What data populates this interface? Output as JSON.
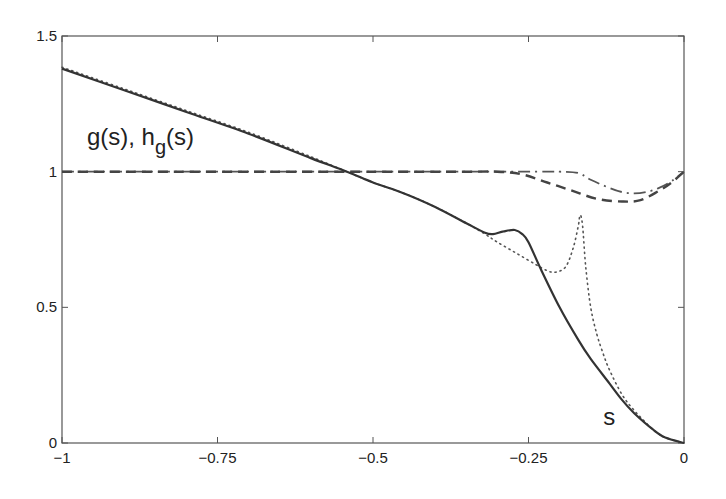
{
  "chart_data": {
    "type": "line",
    "title": "",
    "xlabel": "",
    "ylabel": "",
    "xlim": [
      -1,
      0
    ],
    "ylim": [
      0,
      1.5
    ],
    "grid": false,
    "legend": null,
    "x_ticks": [
      -1,
      -0.75,
      -0.5,
      -0.25,
      0
    ],
    "x_tick_labels": [
      "−1",
      "−0.75",
      "−0.5",
      "−0.25",
      "0"
    ],
    "y_ticks": [
      0,
      0.5,
      1,
      1.5
    ],
    "y_tick_labels": [
      "0",
      "0.5",
      "1",
      "1.5"
    ],
    "annotations": [
      {
        "text": "g(s), h",
        "sub": "g",
        "suffix": "(s)",
        "x": -0.96,
        "y": 1.1
      },
      {
        "text": "s",
        "x": -0.13,
        "y": 0.05
      }
    ],
    "series": [
      {
        "name": "s (solid)",
        "style": "solid",
        "x": [
          -1,
          -0.9,
          -0.8,
          -0.7,
          -0.6,
          -0.542,
          -0.5,
          -0.45,
          -0.4,
          -0.35,
          -0.32,
          -0.307,
          -0.29,
          -0.272,
          -0.26,
          -0.25,
          -0.23,
          -0.2,
          -0.17,
          -0.15,
          -0.12,
          -0.1,
          -0.08,
          -0.05,
          -0.03,
          0
        ],
        "y": [
          1.38,
          1.3,
          1.22,
          1.14,
          1.05,
          1.0,
          0.96,
          0.92,
          0.87,
          0.81,
          0.775,
          0.77,
          0.78,
          0.785,
          0.77,
          0.74,
          0.64,
          0.5,
          0.38,
          0.31,
          0.22,
          0.16,
          0.11,
          0.05,
          0.02,
          0.0
        ]
      },
      {
        "name": "dotted",
        "style": "dotted",
        "x": [
          -1,
          -0.9,
          -0.8,
          -0.7,
          -0.6,
          -0.542,
          -0.5,
          -0.45,
          -0.4,
          -0.35,
          -0.32,
          -0.3,
          -0.27,
          -0.24,
          -0.22,
          -0.206,
          -0.19,
          -0.178,
          -0.17,
          -0.167,
          -0.163,
          -0.158,
          -0.15,
          -0.14,
          -0.13,
          -0.12,
          -0.1,
          -0.08,
          -0.05,
          -0.03,
          0
        ],
        "y": [
          1.385,
          1.305,
          1.225,
          1.145,
          1.055,
          1.0,
          0.96,
          0.92,
          0.87,
          0.81,
          0.77,
          0.74,
          0.7,
          0.66,
          0.635,
          0.63,
          0.65,
          0.72,
          0.8,
          0.84,
          0.8,
          0.65,
          0.5,
          0.4,
          0.33,
          0.27,
          0.18,
          0.12,
          0.05,
          0.02,
          0.0
        ]
      },
      {
        "name": "dashed",
        "style": "dashed",
        "x": [
          -1,
          -0.5,
          -0.35,
          -0.3,
          -0.26,
          -0.22,
          -0.18,
          -0.14,
          -0.1,
          -0.07,
          -0.04,
          -0.02,
          0
        ],
        "y": [
          1.0,
          1.0,
          1.0,
          1.0,
          0.99,
          0.96,
          0.93,
          0.9,
          0.89,
          0.895,
          0.93,
          0.96,
          1.0
        ]
      },
      {
        "name": "dash-dot",
        "style": "dashdot",
        "x": [
          -1,
          -0.5,
          -0.25,
          -0.2,
          -0.17,
          -0.15,
          -0.12,
          -0.1,
          -0.08,
          -0.06,
          -0.04,
          -0.02,
          0
        ],
        "y": [
          1.0,
          1.0,
          1.0,
          1.0,
          0.995,
          0.97,
          0.94,
          0.925,
          0.92,
          0.925,
          0.94,
          0.965,
          1.0
        ]
      }
    ]
  }
}
